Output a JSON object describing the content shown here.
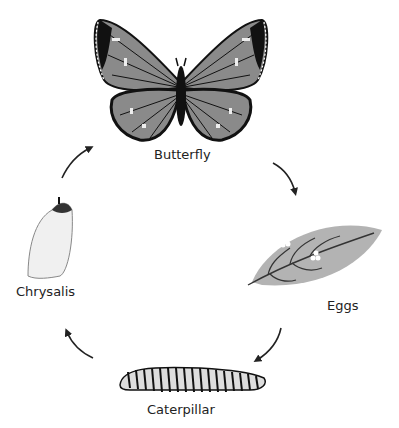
{
  "diagram": {
    "stages": [
      {
        "id": "butterfly",
        "label": "Butterfly",
        "icon": "butterfly-icon"
      },
      {
        "id": "eggs",
        "label": "Eggs",
        "icon": "leaf-with-eggs-icon"
      },
      {
        "id": "caterpillar",
        "label": "Caterpillar",
        "icon": "caterpillar-icon"
      },
      {
        "id": "chrysalis",
        "label": "Chrysalis",
        "icon": "chrysalis-icon"
      }
    ],
    "arrows": [
      {
        "from": "butterfly",
        "to": "eggs"
      },
      {
        "from": "eggs",
        "to": "caterpillar"
      },
      {
        "from": "caterpillar",
        "to": "chrysalis"
      },
      {
        "from": "chrysalis",
        "to": "butterfly"
      }
    ],
    "colors": {
      "background": "#ffffff",
      "wing_fill": "#8a8a8a",
      "wing_outline": "#111111",
      "wing_spots": "#eeeeee",
      "leaf": "#b3b3b3",
      "arrow": "#222222",
      "text": "#222222"
    }
  }
}
